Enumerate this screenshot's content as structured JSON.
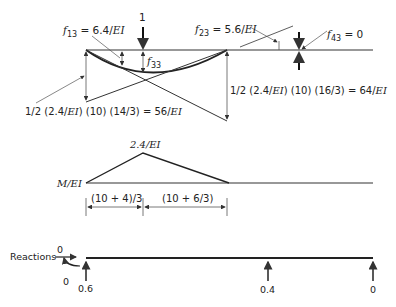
{
  "beam_diagram": {
    "load_label": "1",
    "f13": {
      "symbol": "f",
      "sub": "13",
      "value": " = 6.4/",
      "unit": "EI"
    },
    "f23": {
      "symbol": "f",
      "sub": "23",
      "value": " = 5.6/",
      "unit": "EI"
    },
    "f33": {
      "symbol": "f",
      "sub": "33"
    },
    "f43": {
      "symbol": "f",
      "sub": "43",
      "value": " = 0"
    },
    "left_reaction": {
      "text": "1/2 (2.4/",
      "unit": "EI",
      "rest": ") (10) (14/3) = 56/",
      "unit2": "EI"
    },
    "right_reaction": {
      "text": "1/2 (2.4/",
      "unit": "EI",
      "rest": ") (10) (16/3) = 64/",
      "unit2": "EI"
    }
  },
  "moment_diagram": {
    "axis_label": "M/EI",
    "peak_label": "2.4/EI",
    "dim_left": "(10 + 4)/3",
    "dim_right": "(10 + 6/3)"
  },
  "reactions": {
    "label": "Reactions",
    "horizontal": "0",
    "moment": "0",
    "values": [
      "0.6",
      "0.4",
      "0"
    ]
  },
  "colors": {
    "line": "#222222",
    "thin": "#555555"
  }
}
